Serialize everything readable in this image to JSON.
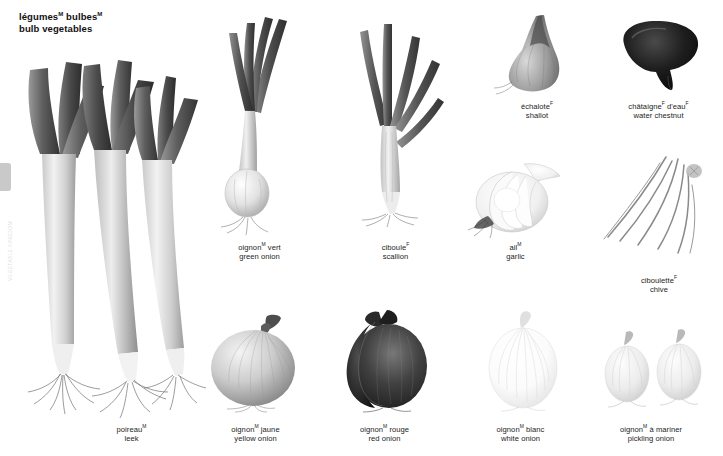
{
  "plate": {
    "title_fr": "légumes",
    "title_fr_sup": "M",
    "title_fr_2": "bulbes",
    "title_fr_2_sup": "M",
    "title_en": "bulb vegetables",
    "side_index_text": "VEGETABLE KINGDOM",
    "background": "#ffffff",
    "text_color": "#1d1d1d",
    "tab_color": "#c9c9c9"
  },
  "items": [
    {
      "id": "shallot",
      "fr": "échalote",
      "fr_sup": "F",
      "en": "shallot",
      "caption_x": 487,
      "caption_y": 99,
      "caption_w": 100
    },
    {
      "id": "water-chestnut",
      "fr": "châtaigne",
      "fr_sup": "F",
      "fr_2": "d'eau",
      "fr_2_sup": "F",
      "en": "water chestnut",
      "caption_x": 601,
      "caption_y": 99,
      "caption_w": 115
    },
    {
      "id": "green-onion",
      "fr": "oignon",
      "fr_sup": "M",
      "fr_2": "vert",
      "en": "green onion",
      "caption_x": 207,
      "caption_y": 240,
      "caption_w": 105
    },
    {
      "id": "scallion",
      "fr": "ciboule",
      "fr_sup": "F",
      "en": "scallion",
      "caption_x": 343,
      "caption_y": 240,
      "caption_w": 105
    },
    {
      "id": "garlic",
      "fr": "ail",
      "fr_sup": "M",
      "en": "garlic",
      "caption_x": 463,
      "caption_y": 240,
      "caption_w": 105
    },
    {
      "id": "chive",
      "fr": "ciboulette",
      "fr_sup": "F",
      "en": "chive",
      "caption_x": 604,
      "caption_y": 273,
      "caption_w": 110
    },
    {
      "id": "leek",
      "fr": "poireau",
      "fr_sup": "M",
      "en": "leek",
      "caption_x": 79,
      "caption_y": 422,
      "caption_w": 105
    },
    {
      "id": "yellow-onion",
      "fr": "oignon",
      "fr_sup": "M",
      "fr_2": "jaune",
      "en": "yellow onion",
      "caption_x": 203,
      "caption_y": 422,
      "caption_w": 105
    },
    {
      "id": "red-onion",
      "fr": "oignon",
      "fr_sup": "M",
      "fr_2": "rouge",
      "en": "red onion",
      "caption_x": 332,
      "caption_y": 422,
      "caption_w": 105
    },
    {
      "id": "white-onion",
      "fr": "oignon",
      "fr_sup": "M",
      "fr_2": "blanc",
      "en": "white onion",
      "caption_x": 468,
      "caption_y": 422,
      "caption_w": 105
    },
    {
      "id": "pickling-onion",
      "fr": "oignon",
      "fr_sup": "M",
      "fr_2": "à mariner",
      "en": "pickling onion",
      "caption_x": 596,
      "caption_y": 422,
      "caption_w": 110
    }
  ]
}
